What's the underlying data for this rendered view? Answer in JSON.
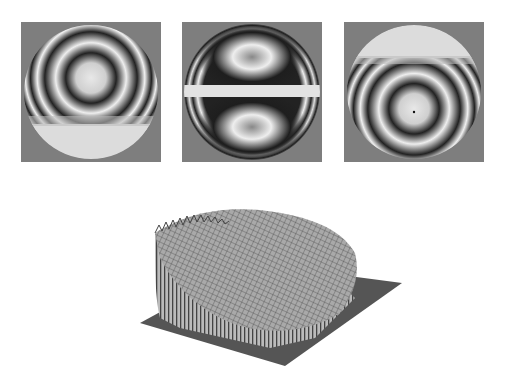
{
  "figure": {
    "panels": [
      {
        "id": "interferogram-1",
        "description": "fringe pattern, center offset upward, bright flat bottom region"
      },
      {
        "id": "interferogram-2",
        "description": "fringe pattern, two lobes top and bottom with bright horizontal band"
      },
      {
        "id": "interferogram-3",
        "description": "fringe pattern, center offset downward, bright flat top region"
      }
    ],
    "surface_plot": {
      "description": "3D wireframe mesh of reconstructed surface on square base"
    }
  },
  "colors": {
    "background": "#ffffff",
    "panel_gray": "#7e7e7e",
    "fringe_dark": "#1a1a1a",
    "fringe_light": "#e6e6e6",
    "mesh": "#3a3a3a"
  }
}
